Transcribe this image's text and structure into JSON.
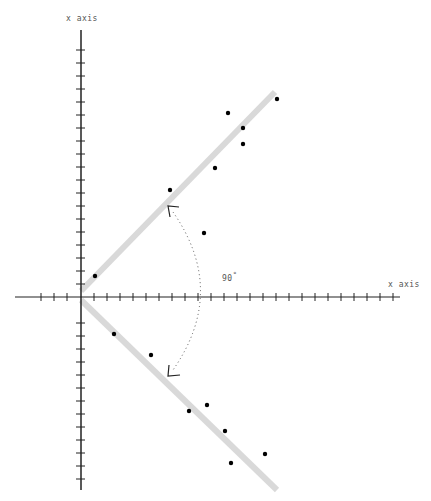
{
  "diagram": {
    "title": "",
    "labels": {
      "y_axis": "x axis",
      "x_axis": "x axis",
      "angle": "90",
      "angle_unit": "°"
    },
    "origin": [
      81,
      297
    ],
    "tick_spacing_px": 13,
    "x_axis": {
      "from": 15,
      "to": 400,
      "ticks_left": [
        41,
        54,
        67
      ],
      "tick_start_right": 94,
      "tick_end_right": 394
    },
    "y_axis": {
      "from": 30,
      "to": 490
    },
    "bands": [
      {
        "name": "upper-line",
        "x1": 81,
        "y1": 291,
        "x2": 275,
        "y2": 92
      },
      {
        "name": "lower-line",
        "x1": 81,
        "y1": 300,
        "x2": 277,
        "y2": 490
      }
    ],
    "points": [
      [
        95,
        276
      ],
      [
        170,
        190
      ],
      [
        204,
        233
      ],
      [
        228,
        113
      ],
      [
        215,
        168
      ],
      [
        243,
        128
      ],
      [
        243,
        144
      ],
      [
        277,
        99
      ],
      [
        114,
        334
      ],
      [
        151,
        355
      ],
      [
        189,
        411
      ],
      [
        207,
        405
      ],
      [
        225,
        431
      ],
      [
        231,
        463
      ],
      [
        265,
        454
      ]
    ],
    "arrows": [
      {
        "name": "upper-arrow",
        "x": 168,
        "y": 206
      },
      {
        "name": "lower-arrow",
        "x": 168,
        "y": 376
      }
    ],
    "colors": {
      "axis": "#222222",
      "band": "#d9d9d9",
      "point": "#000000",
      "arc": "#555555"
    }
  }
}
